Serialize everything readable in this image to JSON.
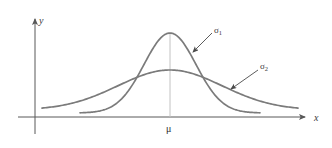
{
  "figure": {
    "title": "",
    "background_color": "#ffffff"
  },
  "axes": {
    "x_label": "x",
    "y_label": "y",
    "axis_color": "#585858",
    "x_axis": {
      "y_px": 117,
      "x_start_px": 18,
      "x_end_px": 310
    },
    "y_axis": {
      "x_px": 35,
      "y_top_px": 14,
      "y_bottom_px": 134
    }
  },
  "annotations": {
    "mean_label": "μ",
    "mean_x_px": 170,
    "mean_label_y_px": 124,
    "curve1_label": "σ",
    "curve1_subscript": "1",
    "curve2_label": "σ",
    "curve2_subscript": "2",
    "curve1_label_pos": {
      "x": 214,
      "y": 26
    },
    "curve2_label_pos": {
      "x": 260,
      "y": 62
    },
    "curve1_arrow": {
      "x1": 212,
      "y1": 33,
      "x2": 193,
      "y2": 52
    },
    "curve2_arrow": {
      "x1": 258,
      "y1": 70,
      "x2": 231,
      "y2": 89
    },
    "arrow_color": "#4a4a4a",
    "center_line_color": "#c2c2c2"
  },
  "chart_data": {
    "type": "line",
    "xlabel": "x",
    "ylabel": "y",
    "grid": false,
    "legend": "annotation-arrows",
    "axis_origin_px": {
      "x": 35,
      "y": 117
    },
    "mean_mu": 0,
    "series": [
      {
        "name": "σ1",
        "description": "narrow tall normal curve (smaller standard deviation)",
        "color": "#7b7b7b",
        "stroke_width": 1.7,
        "peak_px": {
          "x": 170,
          "y": 33
        },
        "baseline_px_y": 113,
        "x_range_px": [
          80,
          260
        ],
        "sigma_px": 26,
        "amplitude_px": 80
      },
      {
        "name": "σ2",
        "description": "wide flat normal curve (larger standard deviation)",
        "color": "#7b7b7b",
        "stroke_width": 1.7,
        "peak_px": {
          "x": 170,
          "y": 73
        },
        "baseline_px_y": 110,
        "x_range_px": [
          42,
          298
        ],
        "sigma_px": 52,
        "amplitude_px": 40
      }
    ],
    "notes": [
      "Both curves are centered at x = μ",
      "σ1 < σ2",
      "Curves cross at two symmetric points either side of μ"
    ]
  }
}
